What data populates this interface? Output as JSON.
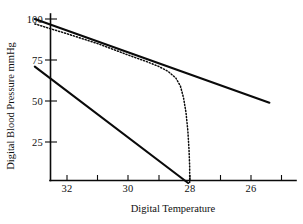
{
  "chart_data": {
    "type": "line",
    "title": "",
    "xlabel": "Digital Temperature",
    "ylabel": "Digital Blood Pressure mmHg",
    "xlim": [
      33.1,
      25.2
    ],
    "ylim": [
      0,
      103
    ],
    "x_axis_reversed": true,
    "grid": false,
    "legend": "none",
    "xticks": [
      32,
      30,
      28,
      26
    ],
    "xtick_labels": [
      "32",
      "30",
      "28",
      "26"
    ],
    "yticks": [
      25,
      50,
      75,
      100
    ],
    "ytick_labels": [
      "25",
      "50",
      "75",
      "100"
    ],
    "series": [
      {
        "name": "upper-solid-line",
        "style": "solid",
        "x": [
          33.05,
          25.4
        ],
        "y": [
          100,
          49
        ]
      },
      {
        "name": "dotted-curve",
        "style": "dotted",
        "x": [
          33.05,
          32.0,
          31.0,
          30.0,
          29.4,
          29.0,
          28.7,
          28.45,
          28.3,
          28.2,
          28.12,
          28.06,
          28.02,
          28.0,
          28.0
        ],
        "y": [
          97,
          91,
          85,
          78,
          74,
          71,
          68,
          64,
          59,
          52,
          43,
          32,
          20,
          10,
          0
        ]
      },
      {
        "name": "lower-solid-line",
        "style": "solid",
        "x": [
          33.05,
          28.05
        ],
        "y": [
          71,
          0
        ]
      }
    ]
  },
  "axis": {
    "x_label": "Digital Temperature",
    "y_label": "Digital Blood Pressure mmHg",
    "x_ticks": [
      {
        "value": "32",
        "px": 67
      },
      {
        "value": "30",
        "px": 128
      },
      {
        "value": "28",
        "px": 190
      },
      {
        "value": "26",
        "px": 251
      }
    ],
    "y_ticks": [
      {
        "value": "100",
        "px": 19
      },
      {
        "value": "75",
        "px": 60
      },
      {
        "value": "50",
        "px": 101
      },
      {
        "value": "25",
        "px": 142
      }
    ]
  }
}
